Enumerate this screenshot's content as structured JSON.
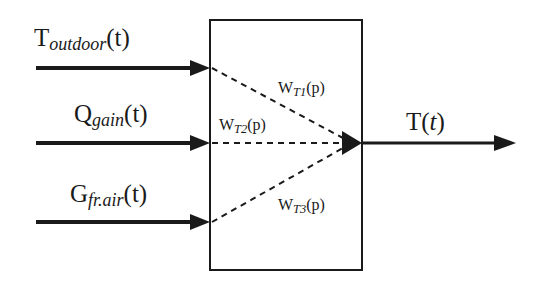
{
  "diagram": {
    "type": "block-diagram",
    "colors": {
      "stroke": "#1a1a1a",
      "background": "#ffffff"
    },
    "inputs": [
      {
        "base": "T",
        "subscript": "outdoor",
        "arg": "(t)"
      },
      {
        "base": "Q",
        "subscript": "gain",
        "arg": "(t)"
      },
      {
        "base": "G",
        "subscript": "fr.air",
        "arg": "(t)"
      }
    ],
    "weights": [
      {
        "base": "W",
        "subscript": "T1",
        "arg": "(p)"
      },
      {
        "base": "W",
        "subscript": "T2",
        "arg": "(p)"
      },
      {
        "base": "W",
        "subscript": "T3",
        "arg": "(p)"
      }
    ],
    "output": {
      "base": "T(",
      "var": "t",
      "close": ")"
    }
  }
}
